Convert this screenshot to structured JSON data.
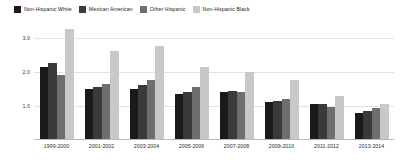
{
  "chart_data": {
    "type": "bar",
    "title": "",
    "subtitle": "",
    "xlabel": "",
    "ylabel": "",
    "categories": [
      "1999-2000",
      "2001-2002",
      "2003-2004",
      "2005-2006",
      "2007-2008",
      "2009-2010",
      "2011-2012",
      "2013-2014"
    ],
    "series": [
      {
        "name": "Non-Hispanic White",
        "color": "#1a1a1a",
        "values": [
          2.15,
          1.5,
          1.5,
          1.35,
          1.4,
          1.1,
          1.05,
          0.8
        ]
      },
      {
        "name": "Mexican American",
        "color": "#3a3a3a",
        "values": [
          2.25,
          1.55,
          1.6,
          1.4,
          1.45,
          1.15,
          1.05,
          0.85
        ]
      },
      {
        "name": "Other Hispanic",
        "color": "#6e6e6e",
        "values": [
          1.9,
          1.65,
          1.75,
          1.55,
          1.4,
          1.2,
          0.98,
          0.95
        ]
      },
      {
        "name": "Non-Hispanic Black",
        "color": "#c8c8c8",
        "values": [
          3.25,
          2.6,
          2.75,
          2.15,
          2.0,
          1.75,
          1.3,
          1.05
        ]
      }
    ],
    "ylim": [
      0,
      3.4
    ],
    "yticks": [
      1.0,
      2.0,
      3.0
    ],
    "ytick_labels": [
      "1.0",
      "2.0",
      "3.0"
    ],
    "grid": true,
    "legend_position": "top-left"
  },
  "legend": {
    "items": [
      {
        "label": "Non-Hispanic White",
        "color": "#1a1a1a"
      },
      {
        "label": "Mexican American",
        "color": "#3a3a3a"
      },
      {
        "label": "Other Hispanic",
        "color": "#6e6e6e"
      },
      {
        "label": "Non-Hispanic Black",
        "color": "#c8c8c8"
      }
    ]
  }
}
